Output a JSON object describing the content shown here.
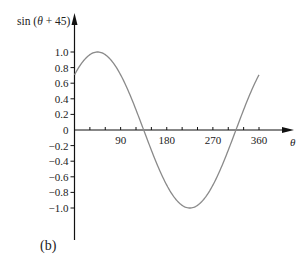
{
  "chart_data": {
    "type": "line",
    "title": "",
    "ylabel": "sin (θ + 45)",
    "xlabel": "θ",
    "caption": "(b)",
    "function": "sin(theta + 45)",
    "x_ticks_labeled": [
      90,
      180,
      270,
      360
    ],
    "x_tick_step": 30,
    "xlim": [
      0,
      360
    ],
    "y_ticks": [
      1.0,
      0.8,
      0.6,
      0.4,
      0.2,
      0,
      -0.2,
      -0.4,
      -0.6,
      -0.8,
      -1.0
    ],
    "y_tick_labels": [
      "1.0",
      "0.8",
      "0.6",
      "0.4",
      "0.2",
      "0",
      "−0.2",
      "−0.4",
      "−0.6",
      "−0.8",
      "−1.0"
    ],
    "ylim": [
      -1.0,
      1.0
    ],
    "grid": false,
    "series": [
      {
        "name": "sin (θ + 45)",
        "color": "#8a8a8a",
        "x": [
          0,
          45,
          90,
          135,
          180,
          225,
          270,
          315,
          360
        ],
        "y": [
          0.707,
          1.0,
          0.707,
          0,
          -0.707,
          -1.0,
          -0.707,
          0,
          0.707
        ]
      }
    ],
    "axis_color": "#111111"
  }
}
